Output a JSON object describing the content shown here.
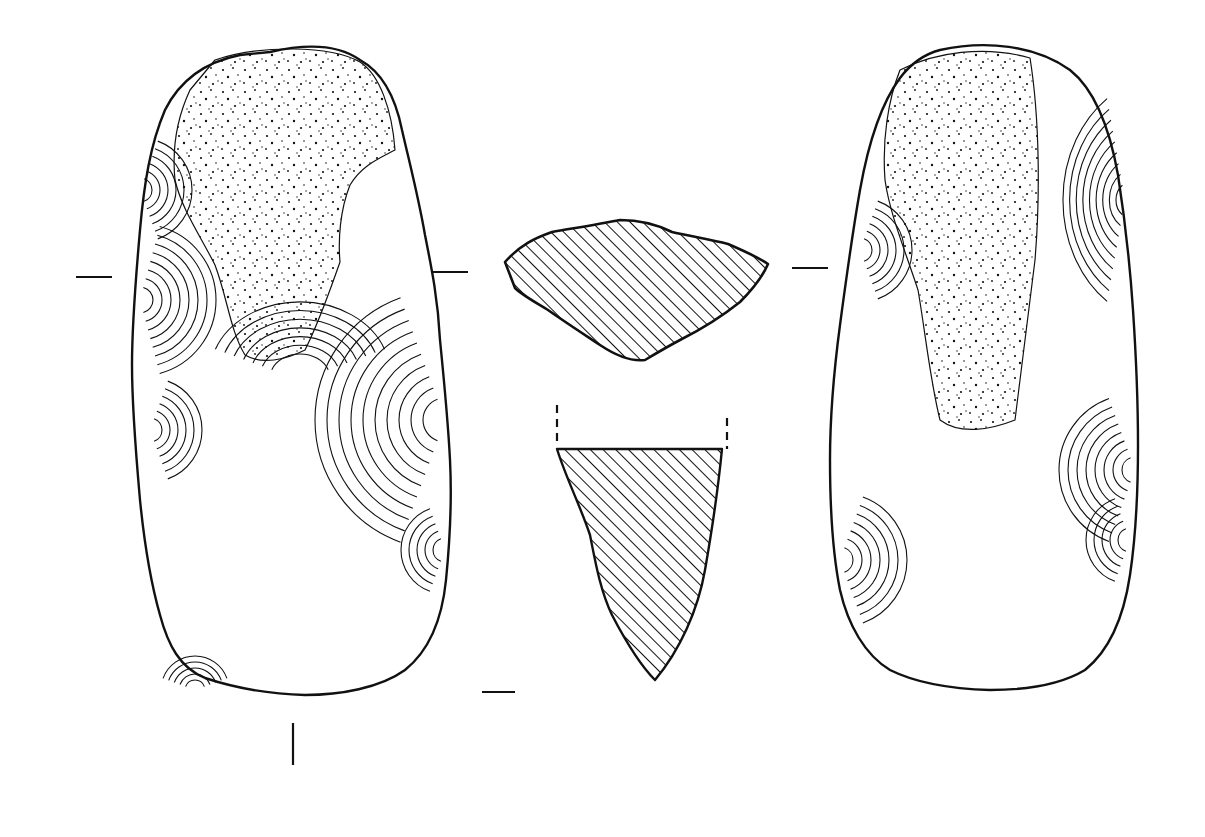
{
  "figure": {
    "width": 1205,
    "height": 837,
    "background": "#ffffff",
    "ink": "#111111",
    "stroke_width": 2.2
  },
  "views": {
    "face_a": {
      "outline": "M270,52 C300,45 335,42 360,60 C382,72 395,95 402,130 C410,165 418,195 425,235 C432,270 438,300 440,340 C444,380 448,420 450,460 C452,500 450,540 446,580 C442,620 430,650 405,670 C380,688 340,695 305,695 C270,694 235,688 205,678 C180,668 168,645 160,615 C150,580 144,540 140,500 C136,455 132,410 132,365 C132,320 136,275 140,230 C144,185 150,145 165,110 C180,80 205,62 240,55 Z",
      "cortex": "M215,60 C260,45 330,45 360,62 C380,75 392,110 395,150 C380,158 362,165 350,185 C340,210 338,240 340,262 C330,290 320,320 305,350 C285,360 262,365 245,355 C230,330 228,300 215,265 C200,235 182,210 175,180 C172,150 176,120 190,90 Z"
    },
    "face_b": {
      "outline": "M940,50 C985,40 1035,45 1070,70 C1095,90 1110,130 1118,175 C1125,220 1130,265 1133,310 C1136,355 1138,400 1138,445 C1138,490 1136,535 1130,575 C1124,615 1110,650 1085,670 C1060,685 1025,690 990,690 C955,689 920,685 890,670 C865,655 848,625 840,590 C832,550 830,505 830,460 C830,415 834,370 840,325 C846,280 852,235 860,190 C868,145 880,105 900,78 C912,62 925,54 940,50 Z",
      "cortex": "M900,70 C935,52 985,45 1030,58 C1040,120 1040,200 1035,260 C1028,320 1020,380 1015,420 C990,430 960,435 940,420 C930,380 925,330 918,290 C905,250 890,215 885,180 C882,140 888,100 900,70 Z"
    },
    "cross_section": {
      "outline": "M505,262 C520,245 535,238 552,232 C575,228 600,224 620,220 C640,220 658,225 672,232 C690,236 712,240 728,244 C742,250 756,256 768,264 C762,278 752,290 740,302 C720,318 700,330 680,340 C665,348 655,354 645,360 C630,362 615,355 600,345 C585,335 565,322 548,310 C535,302 522,295 515,288 Z"
    },
    "long_section": {
      "outline": "M557,449 L722,449 C718,490 712,530 705,570 C698,610 680,650 655,680 C640,665 625,640 612,615 C600,590 595,560 590,535 C580,505 566,478 557,449 Z",
      "cut_marks": [
        {
          "x": 557,
          "y1": 405,
          "y2": 443
        },
        {
          "x": 727,
          "y1": 418,
          "y2": 449
        }
      ]
    }
  },
  "section_markers": [
    {
      "type": "h",
      "x1": 76,
      "x2": 112,
      "y": 277
    },
    {
      "type": "h",
      "x1": 432,
      "x2": 468,
      "y": 272
    },
    {
      "type": "h",
      "x1": 792,
      "x2": 828,
      "y": 268
    },
    {
      "type": "h",
      "x1": 482,
      "x2": 515,
      "y": 692
    },
    {
      "type": "v",
      "x": 293,
      "y1": 723,
      "y2": 765
    }
  ],
  "hatch": {
    "spacing": 9,
    "angle": -45
  }
}
